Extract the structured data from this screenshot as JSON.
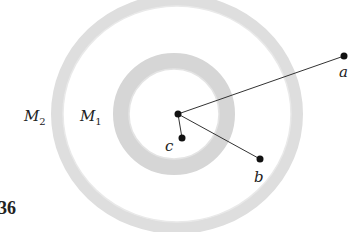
{
  "figure": {
    "number_label": "36",
    "shells": [
      {
        "name": "M",
        "subscript": "2",
        "label_x": 24,
        "label_y": 121
      },
      {
        "name": "M",
        "subscript": "1",
        "label_x": 80,
        "label_y": 121
      }
    ],
    "points": [
      {
        "label": "a",
        "x": 344,
        "y": 56
      },
      {
        "label": "b",
        "x": 260,
        "y": 159
      },
      {
        "label": "c",
        "x": 182,
        "y": 138
      }
    ],
    "center": {
      "x": 178,
      "y": 114
    },
    "colors": {
      "shell": "#dcdcdc",
      "ink": "#1a1a1a"
    }
  }
}
